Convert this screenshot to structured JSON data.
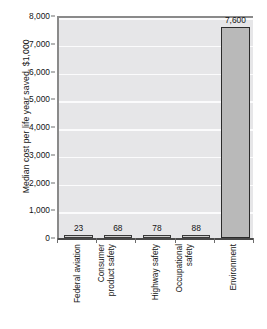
{
  "chart_data": {
    "type": "bar",
    "title": "",
    "xlabel": "",
    "ylabel": "Median cost per life year saved, $1,000",
    "categories": [
      "Federal aviation",
      "Consumer product safety",
      "Highway safety",
      "Occupational safety",
      "Environment"
    ],
    "category_lines": [
      [
        "Federal aviation"
      ],
      [
        "Consumer",
        "product safety"
      ],
      [
        "Highway safety"
      ],
      [
        "Occupational",
        "safety"
      ],
      [
        "Environment"
      ]
    ],
    "values": [
      23,
      68,
      78,
      88,
      7600
    ],
    "value_labels": [
      "23",
      "68",
      "78",
      "88",
      "7,600"
    ],
    "ylim": [
      0,
      8000
    ],
    "ytick_values": [
      0,
      1000,
      2000,
      3000,
      4000,
      5000,
      6000,
      7000,
      8000
    ],
    "ytick_labels": [
      "0",
      "1,000",
      "2,000",
      "3,000",
      "4,000",
      "5,000",
      "6,000",
      "7,000",
      "8,000"
    ],
    "grid": true,
    "legend": "none",
    "colors": {
      "plot_background": "#e6e6e8",
      "gridline": "#fbfbfc",
      "bar_fill": "#b9b9b9",
      "bar_edge": "#2b2b2b",
      "axis": "#6d6d6d",
      "text": "#141414",
      "page_background": "#ffffff"
    }
  }
}
